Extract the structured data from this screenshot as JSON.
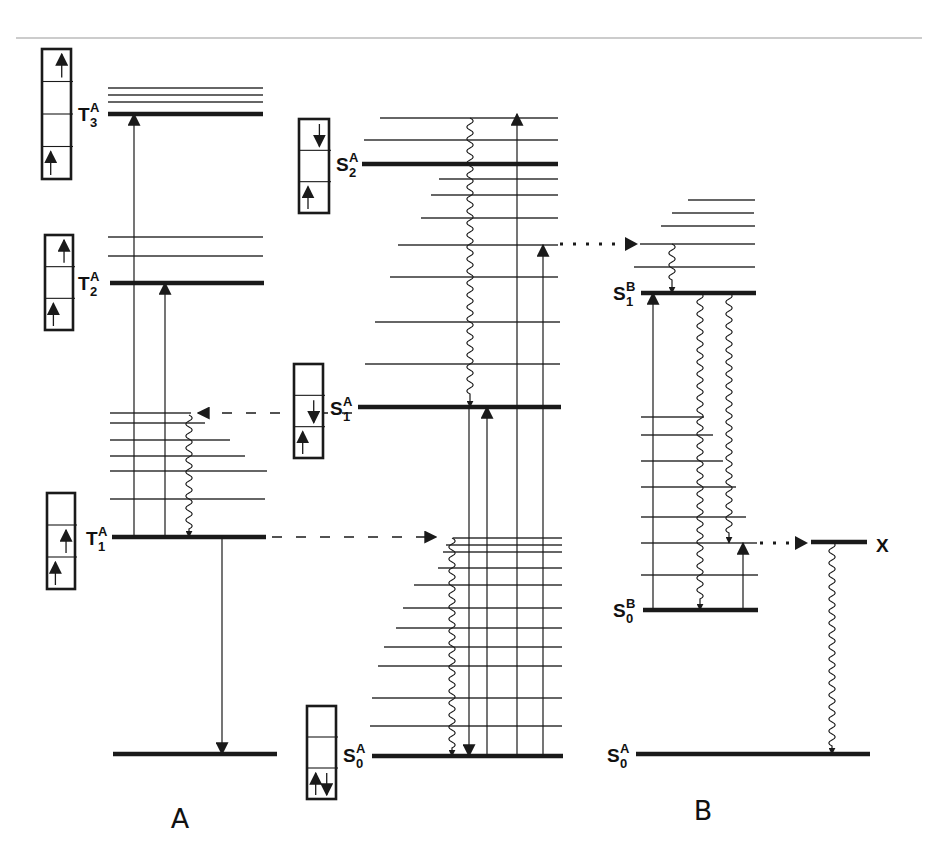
{
  "diagram": {
    "colors": {
      "line": "#1a1a1a",
      "thin": "#333333",
      "rule": "#9a9a9a",
      "bg": "#ffffff"
    },
    "panel_labels": [
      {
        "id": "A",
        "text": "A",
        "x": 180,
        "y": 828
      },
      {
        "id": "B",
        "text": "B",
        "x": 703,
        "y": 820
      }
    ],
    "state_labels": [
      {
        "id": "T3A",
        "base": "T",
        "sub": "3",
        "sup": "A",
        "x": 78,
        "y": 121
      },
      {
        "id": "T2A",
        "base": "T",
        "sub": "2",
        "sup": "A",
        "x": 78,
        "y": 290
      },
      {
        "id": "T1A",
        "base": "T",
        "sub": "1",
        "sup": "A",
        "x": 86,
        "y": 545
      },
      {
        "id": "S2A",
        "base": "S",
        "sub": "2",
        "sup": "A",
        "x": 336,
        "y": 171
      },
      {
        "id": "S1A",
        "base": "S",
        "sub": "1",
        "sup": "A",
        "x": 330,
        "y": 415
      },
      {
        "id": "S0A_mid",
        "base": "S",
        "sub": "0",
        "sup": "A",
        "x": 343,
        "y": 762
      },
      {
        "id": "S1B",
        "base": "S",
        "sub": "1",
        "sup": "B",
        "x": 613,
        "y": 300
      },
      {
        "id": "S0B",
        "base": "S",
        "sub": "0",
        "sup": "B",
        "x": 613,
        "y": 617
      },
      {
        "id": "S0A_right",
        "base": "S",
        "sub": "0",
        "sup": "A",
        "x": 607,
        "y": 762
      },
      {
        "id": "X",
        "base": "X",
        "sub": "",
        "sup": "",
        "x": 876,
        "y": 552
      }
    ],
    "thick_levels": [
      {
        "id": "T3A",
        "x1": 108,
        "x2": 263,
        "y": 114
      },
      {
        "id": "T2A",
        "x1": 110,
        "x2": 264,
        "y": 283
      },
      {
        "id": "T1A",
        "x1": 112,
        "x2": 266,
        "y": 537
      },
      {
        "id": "A_ground",
        "x1": 113,
        "x2": 277,
        "y": 754
      },
      {
        "id": "S2A",
        "x1": 362,
        "x2": 558,
        "y": 164
      },
      {
        "id": "S1A",
        "x1": 358,
        "x2": 561,
        "y": 407
      },
      {
        "id": "S0A_mid",
        "x1": 372,
        "x2": 563,
        "y": 756
      },
      {
        "id": "S1B",
        "x1": 641,
        "x2": 756,
        "y": 293
      },
      {
        "id": "S0B",
        "x1": 643,
        "x2": 758,
        "y": 610
      },
      {
        "id": "X",
        "x1": 811,
        "x2": 867,
        "y": 542
      },
      {
        "id": "S0A_right",
        "x1": 636,
        "x2": 870,
        "y": 754
      }
    ],
    "thin_levels": [
      {
        "x1": 108,
        "x2": 263,
        "y": 88
      },
      {
        "x1": 108,
        "x2": 263,
        "y": 95
      },
      {
        "x1": 108,
        "x2": 263,
        "y": 102
      },
      {
        "x1": 108,
        "x2": 263,
        "y": 237
      },
      {
        "x1": 108,
        "x2": 263,
        "y": 256
      },
      {
        "x1": 110,
        "x2": 191,
        "y": 413
      },
      {
        "x1": 110,
        "x2": 205,
        "y": 423
      },
      {
        "x1": 110,
        "x2": 230,
        "y": 440
      },
      {
        "x1": 110,
        "x2": 245,
        "y": 456
      },
      {
        "x1": 110,
        "x2": 267,
        "y": 471
      },
      {
        "x1": 110,
        "x2": 265,
        "y": 499
      },
      {
        "x1": 380,
        "x2": 558,
        "y": 118
      },
      {
        "x1": 364,
        "x2": 558,
        "y": 140
      },
      {
        "x1": 439,
        "x2": 558,
        "y": 179
      },
      {
        "x1": 431,
        "x2": 558,
        "y": 195
      },
      {
        "x1": 421,
        "x2": 558,
        "y": 218
      },
      {
        "x1": 398,
        "x2": 558,
        "y": 245
      },
      {
        "x1": 390,
        "x2": 558,
        "y": 277
      },
      {
        "x1": 375,
        "x2": 560,
        "y": 322
      },
      {
        "x1": 365,
        "x2": 560,
        "y": 364
      },
      {
        "x1": 453,
        "x2": 562,
        "y": 538
      },
      {
        "x1": 446,
        "x2": 562,
        "y": 545
      },
      {
        "x1": 443,
        "x2": 562,
        "y": 552
      },
      {
        "x1": 438,
        "x2": 562,
        "y": 568
      },
      {
        "x1": 414,
        "x2": 562,
        "y": 585
      },
      {
        "x1": 403,
        "x2": 562,
        "y": 608
      },
      {
        "x1": 396,
        "x2": 562,
        "y": 628
      },
      {
        "x1": 384,
        "x2": 562,
        "y": 647
      },
      {
        "x1": 378,
        "x2": 562,
        "y": 666
      },
      {
        "x1": 372,
        "x2": 562,
        "y": 698
      },
      {
        "x1": 370,
        "x2": 562,
        "y": 726
      },
      {
        "x1": 688,
        "x2": 755,
        "y": 200
      },
      {
        "x1": 672,
        "x2": 754,
        "y": 213
      },
      {
        "x1": 661,
        "x2": 755,
        "y": 226
      },
      {
        "x1": 640,
        "x2": 755,
        "y": 244
      },
      {
        "x1": 634,
        "x2": 755,
        "y": 267
      },
      {
        "x1": 641,
        "x2": 704,
        "y": 417
      },
      {
        "x1": 641,
        "x2": 713,
        "y": 435
      },
      {
        "x1": 641,
        "x2": 723,
        "y": 461
      },
      {
        "x1": 641,
        "x2": 736,
        "y": 487
      },
      {
        "x1": 641,
        "x2": 746,
        "y": 517
      },
      {
        "x1": 641,
        "x2": 758,
        "y": 575
      }
    ],
    "x_feed_line": {
      "x1": 641,
      "x2": 757,
      "y": 543
    },
    "arrows_solid": [
      {
        "x": 134,
        "y1": 537,
        "y2": 114,
        "dir": "up"
      },
      {
        "x": 165,
        "y1": 537,
        "y2": 283,
        "dir": "up"
      },
      {
        "x": 222,
        "y1": 537,
        "y2": 754,
        "dir": "down"
      },
      {
        "x": 469,
        "y1": 407,
        "y2": 756,
        "dir": "down"
      },
      {
        "x": 487,
        "y1": 756,
        "y2": 407,
        "dir": "up"
      },
      {
        "x": 517,
        "y1": 756,
        "y2": 114,
        "dir": "up"
      },
      {
        "x": 543,
        "y1": 756,
        "y2": 245,
        "dir": "up"
      },
      {
        "x": 653,
        "y1": 610,
        "y2": 293,
        "dir": "up"
      },
      {
        "x": 743,
        "y1": 610,
        "y2": 543,
        "dir": "up"
      }
    ],
    "arrows_wavy": [
      {
        "x": 470,
        "y1": 118,
        "y2": 407
      },
      {
        "x": 189,
        "y1": 415,
        "y2": 537
      },
      {
        "x": 452,
        "y1": 538,
        "y2": 756
      },
      {
        "x": 672,
        "y1": 244,
        "y2": 293
      },
      {
        "x": 700,
        "y1": 293,
        "y2": 610
      },
      {
        "x": 729,
        "y1": 293,
        "y2": 543
      },
      {
        "x": 832,
        "y1": 542,
        "y2": 754
      }
    ],
    "arrows_dashed": [
      {
        "id": "S1A_to_T_manifold",
        "x1": 352,
        "x2": 198,
        "y": 413
      },
      {
        "id": "T1A_to_S0_manifold",
        "x1": 272,
        "x2": 436,
        "y": 537
      }
    ],
    "arrows_dotted": [
      {
        "id": "S_to_S1B_manifold",
        "x1": 560,
        "x2": 638,
        "y": 244
      },
      {
        "id": "S0B_manifold_to_X",
        "x1": 760,
        "x2": 808,
        "y": 543
      }
    ],
    "spin_boxes": [
      {
        "id": "T3A",
        "x": 42,
        "y": 49,
        "w": 29,
        "h": 130,
        "rows": 4,
        "arrows": [
          {
            "row": 0,
            "dir": "up",
            "pos": "right"
          },
          {
            "row": 3,
            "dir": "up",
            "pos": "left"
          }
        ]
      },
      {
        "id": "T2A",
        "x": 45,
        "y": 235,
        "w": 28,
        "h": 95,
        "rows": 3,
        "arrows": [
          {
            "row": 0,
            "dir": "up",
            "pos": "right"
          },
          {
            "row": 2,
            "dir": "up",
            "pos": "left"
          }
        ]
      },
      {
        "id": "T1A",
        "x": 47,
        "y": 493,
        "w": 28,
        "h": 96,
        "rows": 3,
        "arrows": [
          {
            "row": 1,
            "dir": "up",
            "pos": "right"
          },
          {
            "row": 2,
            "dir": "up",
            "pos": "left"
          }
        ]
      },
      {
        "id": "S2A",
        "x": 299,
        "y": 119,
        "w": 30,
        "h": 94,
        "rows": 3,
        "arrows": [
          {
            "row": 0,
            "dir": "down",
            "pos": "right"
          },
          {
            "row": 2,
            "dir": "up",
            "pos": "left"
          }
        ]
      },
      {
        "id": "S1A",
        "x": 294,
        "y": 364,
        "w": 29,
        "h": 94,
        "rows": 3,
        "arrows": [
          {
            "row": 1,
            "dir": "down",
            "pos": "right"
          },
          {
            "row": 2,
            "dir": "up",
            "pos": "left"
          }
        ]
      },
      {
        "id": "S0A",
        "x": 307,
        "y": 706,
        "w": 29,
        "h": 93,
        "rows": 3,
        "arrows": [
          {
            "row": 2,
            "dir": "up",
            "pos": "left"
          },
          {
            "row": 2,
            "dir": "down",
            "pos": "right"
          }
        ]
      }
    ],
    "header_rule": {
      "x1": 16,
      "x2": 922,
      "y": 38
    }
  }
}
